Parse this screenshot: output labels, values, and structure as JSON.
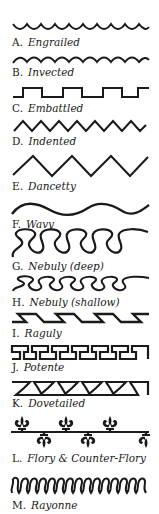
{
  "diagram": {
    "ink_color": "#1a1a1a",
    "background": "#ffffff",
    "items": [
      {
        "letter": "A.",
        "name": "Engrailed",
        "label_y": 36
      },
      {
        "letter": "B.",
        "name": "Invected",
        "label_y": 66
      },
      {
        "letter": "C.",
        "name": "Embattled",
        "label_y": 102
      },
      {
        "letter": "D.",
        "name": "Indented",
        "label_y": 135
      },
      {
        "letter": "E.",
        "name": "Dancetty",
        "label_y": 180
      },
      {
        "letter": "F.",
        "name": "Wavy",
        "label_y": 218
      },
      {
        "letter": "G.",
        "name": "Nebuly (deep)",
        "label_y": 260
      },
      {
        "letter": "H.",
        "name": "Nebuly (shallow)",
        "label_y": 296
      },
      {
        "letter": "I.",
        "name": "Raguly",
        "label_y": 327
      },
      {
        "letter": "J.",
        "name": "Potente",
        "label_y": 361
      },
      {
        "letter": "K.",
        "name": "Dovetailed",
        "label_y": 397
      },
      {
        "letter": "L.",
        "name": "Flory & Counter-Flory",
        "label_y": 452
      },
      {
        "letter": "M.",
        "name": "Rayonne",
        "label_y": 499
      }
    ]
  }
}
